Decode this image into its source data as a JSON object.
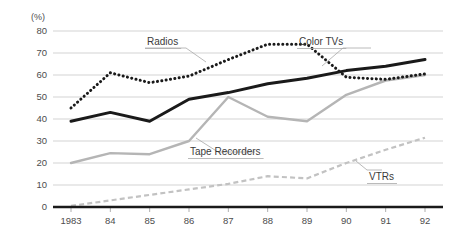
{
  "chart_data": {
    "type": "line",
    "title": "",
    "subtitle": "",
    "xlabel": "",
    "ylabel": "",
    "unit_label": "(%)",
    "grid": true,
    "legend_position": "inline-annotations",
    "xlim": [
      1983,
      1992
    ],
    "ylim": [
      0,
      80
    ],
    "ytick_step": 10,
    "categories": [
      "1983",
      "84",
      "85",
      "86",
      "87",
      "88",
      "89",
      "90",
      "91",
      "92"
    ],
    "x": [
      1983,
      1984,
      1985,
      1986,
      1987,
      1988,
      1989,
      1990,
      1991,
      1992
    ],
    "yticks": [
      "0",
      "10",
      "20",
      "30",
      "40",
      "50",
      "60",
      "70",
      "80"
    ],
    "series": [
      {
        "name": "Radios",
        "style": "dotted",
        "color": "#1a1a1a",
        "values": [
          45,
          61,
          56.5,
          59.5,
          67,
          74,
          74,
          59,
          58,
          60.5
        ]
      },
      {
        "name": "Color TVs",
        "style": "solid-thick",
        "color": "#1a1a1a",
        "values": [
          39,
          43,
          39,
          49,
          52,
          56,
          58.5,
          62,
          64,
          67
        ]
      },
      {
        "name": "Tape Recorders",
        "style": "solid",
        "color": "#b5b5b5",
        "values": [
          20,
          24.5,
          24,
          30,
          50,
          41,
          39,
          51,
          57.5,
          60
        ]
      },
      {
        "name": "VTRs",
        "style": "dashed",
        "color": "#c2c2c2",
        "values": [
          0.5,
          3,
          5.5,
          8,
          10.5,
          14,
          13,
          20,
          26,
          31.5
        ]
      }
    ],
    "annotations": [
      {
        "text": "Radios",
        "series": "Radios"
      },
      {
        "text": "Color TVs",
        "series": "Color TVs"
      },
      {
        "text": "Tape Recorders",
        "series": "Tape Recorders"
      },
      {
        "text": "VTRs",
        "series": "VTRs"
      }
    ]
  },
  "colors": {
    "background": "#ffffff",
    "gridline": "#c8c8c8",
    "axis": "#1a1a1a",
    "tick_text": "#4d4d4d",
    "label_text": "#3a3a3a",
    "radios": "#1a1a1a",
    "color_tvs": "#1a1a1a",
    "tape_recorders": "#b5b5b5",
    "vtrs": "#c2c2c2"
  }
}
